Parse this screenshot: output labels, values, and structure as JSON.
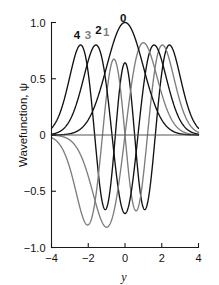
{
  "chart_data": {
    "type": "line",
    "title": "",
    "xlabel": "y",
    "ylabel": "Wavefunction, ψ",
    "xlim": [
      -4,
      4
    ],
    "ylim": [
      -1.0,
      1.0
    ],
    "grid": false,
    "legend_position": "inline-curve-labels",
    "xticks": [
      -4,
      -2,
      0,
      2,
      4
    ],
    "xticklabels": [
      "−4",
      "−2",
      "0",
      "2",
      "4"
    ],
    "yticks": [
      -1.0,
      -0.5,
      0,
      0.5,
      1.0
    ],
    "yticklabels": [
      "−1.0",
      "−0.5",
      "0",
      "0.5",
      "1.0"
    ],
    "series": [
      {
        "name": "0",
        "n": 0,
        "color": "#111111",
        "amplitude": 1.0,
        "label_x": -0.1,
        "label_y": 1.04,
        "peak_values": [
          {
            "x": 0,
            "y": 1.0
          }
        ],
        "nodes": []
      },
      {
        "name": "1",
        "n": 1,
        "color": "#7d7d7d",
        "amplitude": 0.82,
        "label_x": -1.02,
        "label_y": 0.92,
        "peak_values": [
          {
            "x": -0.707,
            "y": 0.82
          },
          {
            "x": 0.707,
            "y": -0.82
          }
        ],
        "nodes": [
          0
        ]
      },
      {
        "name": "2",
        "n": 2,
        "color": "#111111",
        "amplitude": 0.8,
        "label_x": -1.45,
        "label_y": 0.93,
        "peak_values": [
          {
            "x": -1.52,
            "y": 0.8
          },
          {
            "x": 0,
            "y": -0.72
          },
          {
            "x": 1.52,
            "y": 0.8
          }
        ],
        "nodes": [
          -0.707,
          0.707
        ]
      },
      {
        "name": "3",
        "n": 3,
        "color": "#7d7d7d",
        "amplitude": 0.8,
        "label_x": -2.02,
        "label_y": 0.89,
        "peak_values": [
          {
            "x": -2.12,
            "y": 0.8
          },
          {
            "x": -0.68,
            "y": -0.62
          },
          {
            "x": 0.68,
            "y": 0.62
          },
          {
            "x": 2.12,
            "y": -0.8
          }
        ],
        "nodes": [
          -1.224,
          0,
          1.224
        ]
      },
      {
        "name": "4",
        "n": 4,
        "color": "#111111",
        "amplitude": 0.8,
        "label_x": -2.62,
        "label_y": 0.89,
        "peak_values": [
          {
            "x": -2.55,
            "y": 0.8
          },
          {
            "x": -1.25,
            "y": -0.63
          },
          {
            "x": 0,
            "y": 0.6
          },
          {
            "x": 1.25,
            "y": -0.63
          },
          {
            "x": 2.55,
            "y": 0.8
          }
        ],
        "nodes": [
          -1.65,
          -0.525,
          0.525,
          1.65
        ]
      }
    ]
  },
  "colors": {
    "even_curve": "#111111",
    "odd_curve": "#7d7d7d",
    "axis": "#1a1a1a",
    "zero_line": "#555555",
    "background": "#ffffff"
  }
}
